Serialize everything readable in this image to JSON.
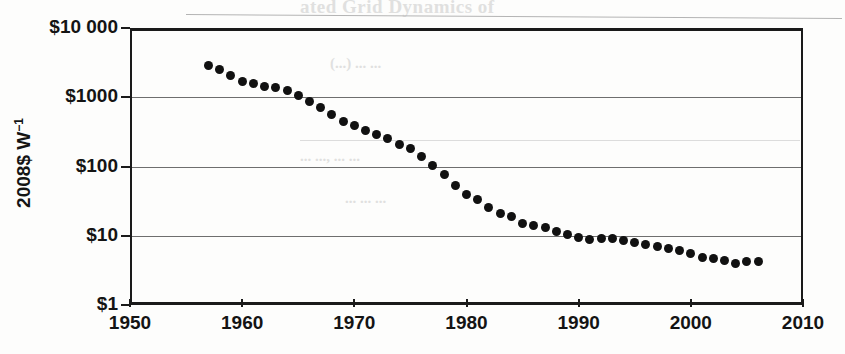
{
  "page": {
    "width": 845,
    "height": 354,
    "background": "#fdfdfc",
    "ink_color": "#111111",
    "grid_color": "#6e6e6e"
  },
  "ghost_text": {
    "top_heading": "ated Grid Dynamics of",
    "mid_line_1": "(...) ... ...",
    "mid_line_2": "...  ..., ...  ...",
    "mid_line_3": "...  ...  ..."
  },
  "chart_data": {
    "type": "scatter",
    "title": "",
    "subtitle": "",
    "xlabel": "",
    "ylabel": "2008$ W-1",
    "ylabel_display": "2008$ W",
    "ylabel_exponent": "−1",
    "xscale": "linear",
    "yscale": "log",
    "xlim": [
      1950,
      2010
    ],
    "ylim": [
      1,
      10000
    ],
    "grid": true,
    "grid_axis": "y",
    "legend": "none",
    "xticks": [
      1950,
      1960,
      1970,
      1980,
      1990,
      2000,
      2010
    ],
    "xticklabels": [
      "1950",
      "1960",
      "1970",
      "1980",
      "1990",
      "2000",
      "2010"
    ],
    "yticks": [
      1,
      10,
      100,
      1000,
      10000
    ],
    "yticklabels": [
      "$1",
      "$10",
      "$100",
      "$1000",
      "$10 000"
    ],
    "marker": "filled-circle",
    "marker_color": "#111111",
    "marker_size_px": 9,
    "series": [
      {
        "name": "PV module price",
        "x": [
          1957,
          1958,
          1959,
          1960,
          1961,
          1962,
          1963,
          1964,
          1965,
          1966,
          1967,
          1968,
          1969,
          1970,
          1971,
          1972,
          1973,
          1974,
          1975,
          1976,
          1977,
          1978,
          1979,
          1980,
          1981,
          1982,
          1983,
          1984,
          1985,
          1986,
          1987,
          1988,
          1989,
          1990,
          1991,
          1992,
          1993,
          1994,
          1995,
          1996,
          1997,
          1998,
          1999,
          2000,
          2001,
          2002,
          2003,
          2004,
          2005,
          2006
        ],
        "y": [
          2900,
          2550,
          2050,
          1700,
          1600,
          1450,
          1400,
          1250,
          1050,
          860,
          700,
          560,
          450,
          390,
          330,
          290,
          250,
          210,
          185,
          140,
          103,
          77,
          54,
          40,
          33,
          26,
          21,
          19,
          15,
          14,
          13,
          11.5,
          10.3,
          9.3,
          8.9,
          9.0,
          9.2,
          8.5,
          8.0,
          7.4,
          7.0,
          6.6,
          6.2,
          5.6,
          4.9,
          4.7,
          4.4,
          4.0,
          4.2,
          4.3
        ]
      }
    ]
  }
}
